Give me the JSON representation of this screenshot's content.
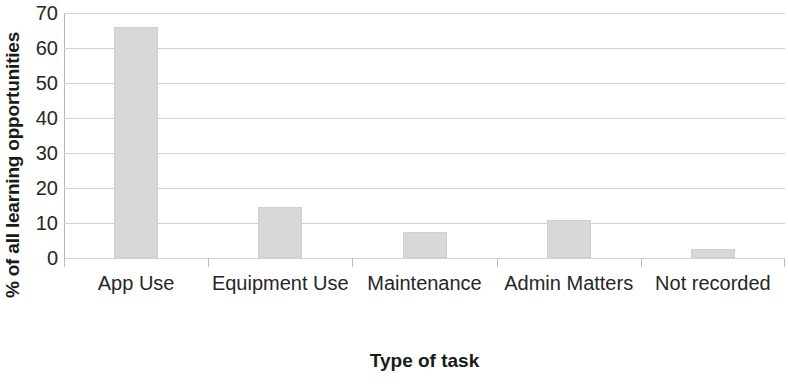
{
  "chart_data": {
    "type": "bar",
    "title": "",
    "categories": [
      "App Use",
      "Equipment Use",
      "Maintenance",
      "Admin Matters",
      "Not recorded"
    ],
    "values": [
      66,
      14.5,
      7.5,
      11,
      2.5
    ],
    "xlabel": "Type of task",
    "ylabel": "% of all learning opportunities",
    "ylim": [
      0,
      70
    ],
    "yticks": [
      0,
      10,
      20,
      30,
      40,
      50,
      60,
      70
    ],
    "ytick_labels": [
      "0",
      "10",
      "20",
      "30",
      "40",
      "50",
      "60",
      "70"
    ],
    "grid": "horizontal",
    "legend": "none",
    "bar_color": "#d8d8d8",
    "bar_border_color": "#d0d0d0",
    "gridline_color": "#d2d2d2",
    "axis_color": "#b7b7b7",
    "text_color": "#262626"
  }
}
